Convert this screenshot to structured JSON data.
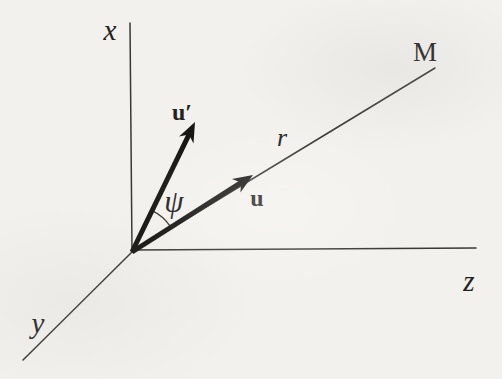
{
  "figure": {
    "type": "vector-diagram",
    "background_color": "#f2f1ed",
    "ink_color": "#181715",
    "labels": {
      "x_axis": "x",
      "y_axis": "y",
      "z_axis": "z",
      "point": "M",
      "radial_line": "r",
      "vector_u": "u",
      "vector_u_prime": "u′",
      "angle": "ψ"
    }
  }
}
